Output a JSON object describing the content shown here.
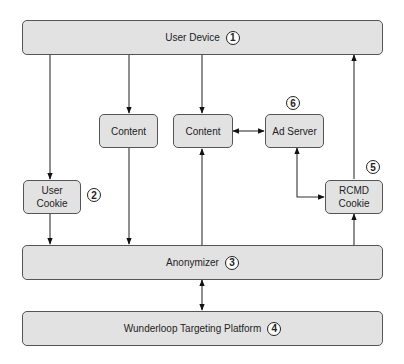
{
  "nodes": {
    "user_device": {
      "label": "User Device",
      "number": "1"
    },
    "user_cookie": {
      "label": "User\nCookie",
      "number": "2"
    },
    "anonymizer": {
      "label": "Anonymizer",
      "number": "3"
    },
    "wunderloop": {
      "label": "Wunderloop Targeting Platform",
      "number": "4"
    },
    "rcmd_cookie": {
      "label": "RCMD\nCookie",
      "number": "5"
    },
    "ad_server": {
      "label": "Ad Server",
      "number": "6"
    },
    "content_1": {
      "label": "Content"
    },
    "content_2": {
      "label": "Content"
    }
  },
  "edges": [
    {
      "from": "User Device",
      "to": "User Cookie"
    },
    {
      "from": "User Device",
      "to": "Content (left)"
    },
    {
      "from": "User Device",
      "to": "Content (right)"
    },
    {
      "from": "Content (right)",
      "to": "Ad Server",
      "bidirectional": true
    },
    {
      "from": "Ad Server",
      "to": "RCMD Cookie",
      "bidirectional": true
    },
    {
      "from": "RCMD Cookie",
      "to": "User Device"
    },
    {
      "from": "User Cookie",
      "to": "Anonymizer"
    },
    {
      "from": "Content (left)",
      "to": "Anonymizer"
    },
    {
      "from": "Anonymizer",
      "to": "Content (right)"
    },
    {
      "from": "Anonymizer",
      "to": "RCMD Cookie"
    },
    {
      "from": "Anonymizer",
      "to": "Wunderloop Targeting Platform",
      "bidirectional": true
    }
  ]
}
